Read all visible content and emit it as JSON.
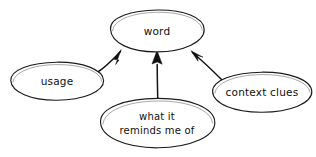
{
  "diagram": {
    "type": "concept-map",
    "style": "hand-drawn pencil sketch on white paper",
    "background_color": "#ffffff",
    "ink_color": "#111111",
    "central_node": "word",
    "nodes": [
      {
        "id": "word",
        "label": "word",
        "lines": [
          "word"
        ],
        "role": "central",
        "shape": "ellipse",
        "cx": 157,
        "cy": 31,
        "rx": 47,
        "ry": 21
      },
      {
        "id": "usage",
        "label": "usage",
        "lines": [
          "usage"
        ],
        "role": "supporting",
        "shape": "ellipse",
        "cx": 57,
        "cy": 81,
        "rx": 47,
        "ry": 19
      },
      {
        "id": "reminds",
        "label": "what it reminds me of",
        "lines": [
          "what it",
          "reminds me of"
        ],
        "role": "supporting",
        "shape": "ellipse",
        "cx": 157,
        "cy": 123,
        "rx": 57,
        "ry": 25
      },
      {
        "id": "context",
        "label": "context clues",
        "lines": [
          "context clues"
        ],
        "role": "supporting",
        "shape": "ellipse",
        "cx": 262,
        "cy": 92,
        "rx": 50,
        "ry": 20
      }
    ],
    "edges": [
      {
        "id": "usage-to-word",
        "from": "usage",
        "to": "word",
        "direction": "to-center",
        "arrowhead": "solid-triangle"
      },
      {
        "id": "reminds-to-word",
        "from": "reminds",
        "to": "word",
        "direction": "to-center",
        "arrowhead": "solid-triangle"
      },
      {
        "id": "context-to-word",
        "from": "context",
        "to": "word",
        "direction": "to-center",
        "arrowhead": "solid-triangle"
      }
    ]
  }
}
